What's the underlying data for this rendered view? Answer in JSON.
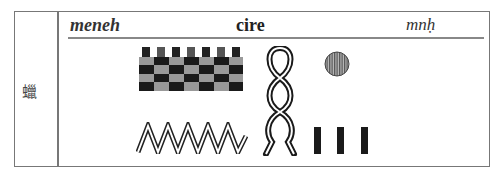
{
  "entry": {
    "side_label": "蠟",
    "transliteration": "meneh",
    "gloss": "cire",
    "transcription": "mnḥ"
  },
  "hieroglyphs": [
    {
      "name": "checkered-block-glyph"
    },
    {
      "name": "water-zigzag-glyph"
    },
    {
      "name": "twisted-rope-glyph"
    },
    {
      "name": "sun-disc-glyph"
    },
    {
      "name": "plural-strokes-glyph",
      "count": 3
    }
  ]
}
